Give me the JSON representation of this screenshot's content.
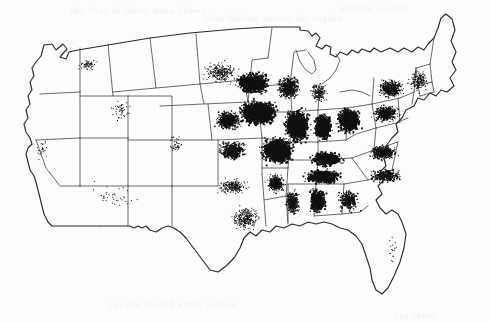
{
  "figure": {
    "kind": "dot-density-map",
    "region": "Contiguous United States",
    "title": "",
    "caption": "",
    "background_color": "#fdfdfc",
    "ink_color": "#111111",
    "outline_color": "#2b2b2b",
    "state_border_color": "#3a3a3a"
  },
  "chart_data": {
    "type": "scatter",
    "title": "",
    "subtitle": "",
    "xlabel": "",
    "ylabel": "",
    "projection": "albers-usa-approx",
    "grid": false,
    "legend": "none",
    "density_scale": {
      "min_label": "0",
      "max_label": "saturated",
      "units": "points per region"
    },
    "regions": [
      {
        "name": "Iowa",
        "density": 100,
        "cx": 258,
        "cy": 112,
        "rx": 30,
        "ry": 20
      },
      {
        "name": "Illinois",
        "density": 98,
        "cx": 296,
        "cy": 125,
        "rx": 20,
        "ry": 26
      },
      {
        "name": "Missouri",
        "density": 92,
        "cx": 277,
        "cy": 150,
        "rx": 26,
        "ry": 22
      },
      {
        "name": "Indiana",
        "density": 86,
        "cx": 322,
        "cy": 126,
        "rx": 15,
        "ry": 22
      },
      {
        "name": "Ohio",
        "density": 78,
        "cx": 348,
        "cy": 120,
        "rx": 20,
        "ry": 21
      },
      {
        "name": "Southern Minnesota",
        "density": 72,
        "cx": 252,
        "cy": 82,
        "rx": 26,
        "ry": 18
      },
      {
        "name": "Wisconsin",
        "density": 55,
        "cx": 288,
        "cy": 87,
        "rx": 18,
        "ry": 20
      },
      {
        "name": "Eastern Nebraska",
        "density": 70,
        "cx": 228,
        "cy": 120,
        "rx": 22,
        "ry": 16
      },
      {
        "name": "Eastern Kansas",
        "density": 62,
        "cx": 232,
        "cy": 150,
        "rx": 22,
        "ry": 16
      },
      {
        "name": "Kentucky",
        "density": 74,
        "cx": 326,
        "cy": 158,
        "rx": 26,
        "ry": 13
      },
      {
        "name": "Tennessee",
        "density": 80,
        "cx": 322,
        "cy": 176,
        "rx": 30,
        "ry": 12
      },
      {
        "name": "Alabama",
        "density": 76,
        "cx": 317,
        "cy": 200,
        "rx": 14,
        "ry": 20
      },
      {
        "name": "Mississippi",
        "density": 58,
        "cx": 292,
        "cy": 202,
        "rx": 12,
        "ry": 20
      },
      {
        "name": "Arkansas",
        "density": 52,
        "cx": 275,
        "cy": 183,
        "rx": 16,
        "ry": 16
      },
      {
        "name": "Pennsylvania",
        "density": 58,
        "cx": 385,
        "cy": 113,
        "rx": 22,
        "ry": 14
      },
      {
        "name": "New York",
        "density": 44,
        "cx": 390,
        "cy": 88,
        "rx": 22,
        "ry": 15
      },
      {
        "name": "Virginia",
        "density": 48,
        "cx": 382,
        "cy": 152,
        "rx": 24,
        "ry": 13
      },
      {
        "name": "North Carolina",
        "density": 44,
        "cx": 385,
        "cy": 175,
        "rx": 26,
        "ry": 11
      },
      {
        "name": "Georgia",
        "density": 40,
        "cx": 348,
        "cy": 200,
        "rx": 18,
        "ry": 18
      },
      {
        "name": "Michigan",
        "density": 30,
        "cx": 318,
        "cy": 92,
        "rx": 14,
        "ry": 18
      },
      {
        "name": "Oklahoma",
        "density": 26,
        "cx": 232,
        "cy": 186,
        "rx": 28,
        "ry": 12
      },
      {
        "name": "East Texas",
        "density": 22,
        "cx": 245,
        "cy": 218,
        "rx": 24,
        "ry": 20
      },
      {
        "name": "Dakotas",
        "density": 18,
        "cx": 220,
        "cy": 72,
        "rx": 30,
        "ry": 18
      },
      {
        "name": "New England",
        "density": 22,
        "cx": 418,
        "cy": 80,
        "rx": 18,
        "ry": 18
      },
      {
        "name": "Eastern Washington",
        "density": 14,
        "cx": 88,
        "cy": 65,
        "rx": 16,
        "ry": 10
      },
      {
        "name": "Colorado Front Range",
        "density": 8,
        "cx": 175,
        "cy": 145,
        "rx": 12,
        "ry": 16
      },
      {
        "name": "Central Valley California",
        "density": 5,
        "cx": 42,
        "cy": 150,
        "rx": 9,
        "ry": 20
      },
      {
        "name": "Utah/Idaho",
        "density": 5,
        "cx": 120,
        "cy": 110,
        "rx": 18,
        "ry": 20
      },
      {
        "name": "Florida",
        "density": 2,
        "cx": 392,
        "cy": 250,
        "rx": 12,
        "ry": 26
      },
      {
        "name": "Southwest Desert",
        "density": 1,
        "cx": 115,
        "cy": 195,
        "rx": 45,
        "ry": 30
      }
    ]
  },
  "scan_artifacts": {
    "enabled": true,
    "ghost_lines": [
      {
        "text": "the first of these maps shows",
        "x": 70,
        "y": 6
      },
      {
        "text": "distribution across the region",
        "x": 205,
        "y": 14
      },
      {
        "text": "and the second",
        "x": 340,
        "y": 4
      },
      {
        "text": "for the period under review",
        "x": 110,
        "y": 300
      },
      {
        "text": "see table",
        "x": 395,
        "y": 312
      }
    ]
  }
}
